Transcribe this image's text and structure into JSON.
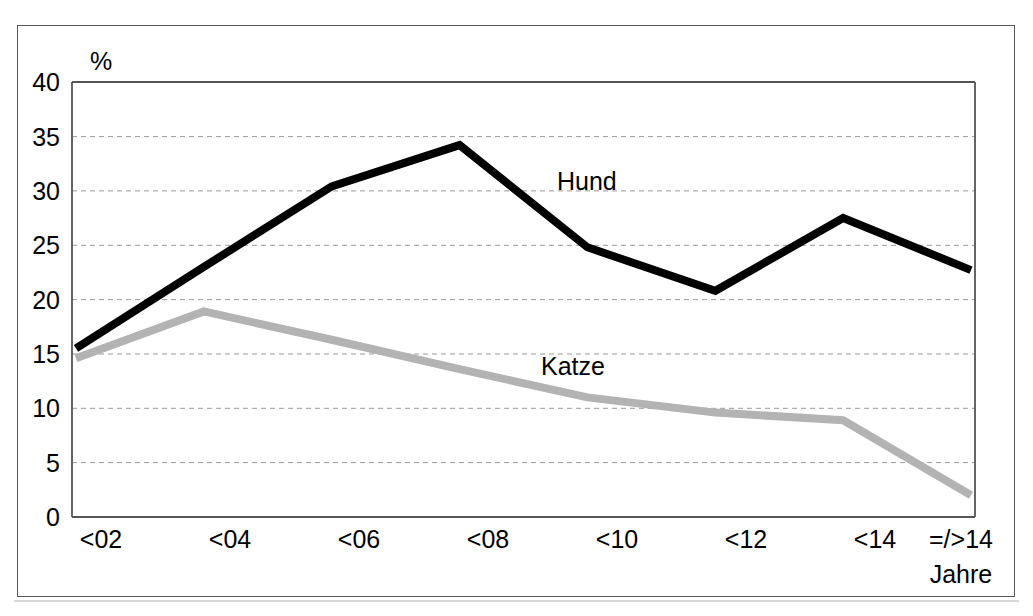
{
  "chart_data": {
    "type": "line",
    "title": "",
    "subtitle": "",
    "xlabel": "Jahre",
    "ylabel": "%",
    "categories": [
      "<02",
      "<04",
      "<06",
      "<08",
      "<10",
      "<12",
      "<14",
      "=/>14"
    ],
    "ylim": [
      0,
      40
    ],
    "yticks": [
      0,
      5,
      10,
      15,
      20,
      25,
      30,
      35,
      40
    ],
    "ytick_labels": [
      "0",
      "5",
      "10",
      "15",
      "20",
      "25",
      "30",
      "35",
      "40"
    ],
    "grid": "horizontal-dashed",
    "legend": "inline-annotation",
    "series": [
      {
        "name": "Hund",
        "color": "#000000",
        "line_width": 8,
        "values": [
          15.5,
          23.0,
          30.4,
          34.2,
          24.8,
          20.8,
          27.5,
          22.7
        ]
      },
      {
        "name": "Katze",
        "color": "#b3b3b3",
        "line_width": 8,
        "values": [
          14.6,
          18.9,
          16.3,
          13.6,
          11.0,
          9.6,
          8.9,
          2.0
        ]
      }
    ],
    "annotations": [
      {
        "text": "Hund",
        "series": "Hund",
        "x_value": "<10",
        "y_value": 31.0
      },
      {
        "text": "Katze",
        "series": "Katze",
        "x_value": "<10",
        "y_value": 15.8
      }
    ]
  },
  "axis": {
    "y_unit_label": "%",
    "x_unit_label": "Jahre"
  },
  "colors": {
    "hund_line": "#000000",
    "katze_line": "#b3b3b3",
    "grid_line": "#9a9a9a",
    "axis_line": "#555555",
    "frame": "#58585a",
    "background": "#ffffff"
  }
}
